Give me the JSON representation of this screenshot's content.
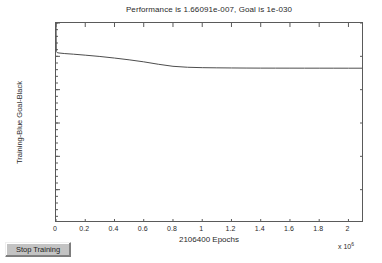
{
  "window": {
    "title": "Performance is 1.66091e-007, Goal is 1e-030"
  },
  "controls": {
    "stop_training_label": "Stop Training"
  },
  "axis": {
    "x_multiplier_base": "x 10",
    "x_multiplier_exponent": "6"
  },
  "chart_data": {
    "type": "line",
    "title": "Performance is 1.66091e-007, Goal is 1e-030",
    "xlabel": "2106400 Epochs",
    "ylabel": "Training-Blue Goal-Black",
    "xscale": "linear",
    "yscale": "log",
    "xlim": [
      0,
      2106400
    ],
    "ylim": [
      1e-30,
      1
    ],
    "grid": false,
    "legend": null,
    "x_tick_labels": [
      "0",
      "0.2",
      "0.4",
      "0.6",
      "0.8",
      "1",
      "1.2",
      "1.4",
      "1.6",
      "1.8",
      "2"
    ],
    "x_tick_values": [
      0,
      200000,
      400000,
      600000,
      800000,
      1000000,
      1200000,
      1400000,
      1600000,
      1800000,
      2000000
    ],
    "x_tick_multiplier": 1000000,
    "y_tick_labels": [
      "10^0",
      "10^-5",
      "10^-10",
      "10^-15",
      "10^-20",
      "10^-25",
      "10^-30"
    ],
    "y_tick_mantissa": [
      "10",
      "10",
      "10",
      "10",
      "10",
      "10",
      "10"
    ],
    "y_tick_exponents": [
      "0",
      "-5",
      "-10",
      "-15",
      "-20",
      "-25",
      "-30"
    ],
    "y_tick_values": [
      1,
      1e-05,
      1e-10,
      1e-15,
      1e-20,
      1e-25,
      1e-30
    ],
    "performance_final": 1.66091e-07,
    "goal": 1e-30,
    "epochs": 2106400,
    "series": [
      {
        "name": "Training",
        "color": "#4d4d4d",
        "x": [
          0,
          2000,
          8000,
          20000,
          60000,
          120000,
          200000,
          300000,
          400000,
          500000,
          600000,
          700000,
          800000,
          900000,
          1000000,
          1100000,
          1200000,
          1300000,
          1400000,
          1500000,
          1600000,
          1700000,
          1800000,
          1900000,
          2000000,
          2106400
        ],
        "y": [
          1.0,
          5e-05,
          3.6e-05,
          3.2e-05,
          2.6e-05,
          2.1e-05,
          1.5e-05,
          9.5e-06,
          5.5e-06,
          3e-06,
          1.5e-06,
          6.5e-07,
          3.2e-07,
          2.3e-07,
          2e-07,
          1.88e-07,
          1.8e-07,
          1.74e-07,
          1.71e-07,
          1.7e-07,
          1.69e-07,
          1.68e-07,
          1.675e-07,
          1.67e-07,
          1.665e-07,
          1.66091e-07
        ]
      }
    ]
  }
}
